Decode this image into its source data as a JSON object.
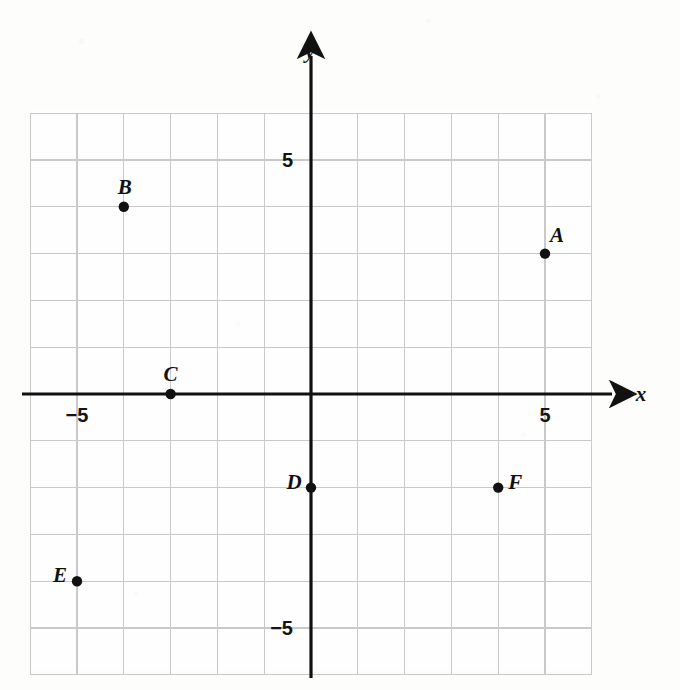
{
  "figure": {
    "kind": "coordinate-plane",
    "background_color": "#fdfdfb",
    "grid_color": "#c9c9c9",
    "axis_color": "#111111",
    "point_color": "#111111",
    "label_color": "#111111"
  },
  "axes": {
    "x_axis_label": "x",
    "y_axis_label": "y",
    "x_ticks": [
      {
        "label": "-5",
        "value": -5
      },
      {
        "label": "5",
        "value": 5
      }
    ],
    "y_ticks": [
      {
        "label": "5",
        "value": 5
      },
      {
        "label": "-5",
        "value": -5
      }
    ]
  },
  "chart_data": {
    "type": "scatter",
    "title": "",
    "xlabel": "x",
    "ylabel": "y",
    "xlim": [
      -6,
      6
    ],
    "ylim": [
      -6,
      6
    ],
    "grid": true,
    "grid_step": 1,
    "legend": "none",
    "xticks": [
      -5,
      5
    ],
    "xticklabels": [
      "-5",
      "5"
    ],
    "yticks": [
      -5,
      5
    ],
    "yticklabels": [
      "5",
      "-5"
    ],
    "points": [
      {
        "label": "A",
        "x": 5,
        "y": 3,
        "label_dx": 12,
        "label_dy": -12
      },
      {
        "label": "B",
        "x": -4,
        "y": 4,
        "label_dx": 1,
        "label_dy": -13
      },
      {
        "label": "C",
        "x": -3,
        "y": 0,
        "label_dx": 0,
        "label_dy": -13
      },
      {
        "label": "D",
        "x": 0,
        "y": -2,
        "label_dx": -17,
        "label_dy": 1
      },
      {
        "label": "E",
        "x": -5,
        "y": -4,
        "label_dx": -17,
        "label_dy": 1
      },
      {
        "label": "F",
        "x": 4,
        "y": -2,
        "label_dx": 17,
        "label_dy": 1
      }
    ]
  }
}
